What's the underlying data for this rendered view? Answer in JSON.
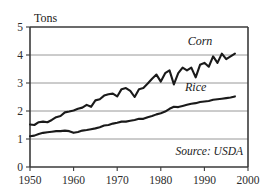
{
  "chart_data": {
    "type": "line",
    "title": "",
    "xlabel": "",
    "ylabel": "Tons",
    "xlim": [
      1950,
      2000
    ],
    "ylim": [
      0,
      5
    ],
    "grid": true,
    "grid_values": [
      1,
      2,
      3,
      4
    ],
    "legend_position": "inline-right",
    "annotations": [
      "Source: USDA"
    ],
    "xticks": [
      "1950",
      "1960",
      "1970",
      "1980",
      "1990",
      "2000"
    ],
    "xtick_values": [
      1950,
      1960,
      1970,
      1980,
      1990,
      2000
    ],
    "yticks": [
      "0",
      "1",
      "2",
      "3",
      "4",
      "5"
    ],
    "ytick_values": [
      0,
      1,
      2,
      3,
      4,
      5
    ],
    "x": [
      1950,
      1951,
      1952,
      1953,
      1954,
      1955,
      1956,
      1957,
      1958,
      1959,
      1960,
      1961,
      1962,
      1963,
      1964,
      1965,
      1966,
      1967,
      1968,
      1969,
      1970,
      1971,
      1972,
      1973,
      1974,
      1975,
      1976,
      1977,
      1978,
      1979,
      1980,
      1981,
      1982,
      1983,
      1984,
      1985,
      1986,
      1987,
      1988,
      1989,
      1990,
      1991,
      1992,
      1993,
      1994,
      1995,
      1996,
      1997
    ],
    "series": [
      {
        "name": "Corn",
        "label": "Corn",
        "color": "#1a1a1a",
        "label_x": 1989,
        "label_y": 4.35,
        "values": [
          1.52,
          1.5,
          1.6,
          1.62,
          1.6,
          1.68,
          1.78,
          1.82,
          1.95,
          1.98,
          2.02,
          2.08,
          2.12,
          2.22,
          2.15,
          2.38,
          2.42,
          2.55,
          2.6,
          2.62,
          2.52,
          2.78,
          2.82,
          2.72,
          2.5,
          2.78,
          2.82,
          2.98,
          3.15,
          3.3,
          3.05,
          3.35,
          3.45,
          2.95,
          3.35,
          3.55,
          3.45,
          3.55,
          3.2,
          3.65,
          3.72,
          3.58,
          3.95,
          3.72,
          4.05,
          3.85,
          3.95,
          4.05
        ]
      },
      {
        "name": "Rice",
        "label": "Rice",
        "color": "#1a1a1a",
        "label_x": 1988,
        "label_y": 2.72,
        "values": [
          1.1,
          1.12,
          1.18,
          1.22,
          1.24,
          1.26,
          1.28,
          1.28,
          1.3,
          1.28,
          1.22,
          1.25,
          1.3,
          1.32,
          1.35,
          1.38,
          1.42,
          1.48,
          1.5,
          1.55,
          1.58,
          1.62,
          1.62,
          1.65,
          1.68,
          1.72,
          1.72,
          1.78,
          1.82,
          1.88,
          1.92,
          1.98,
          2.08,
          2.15,
          2.14,
          2.18,
          2.22,
          2.26,
          2.28,
          2.32,
          2.34,
          2.36,
          2.4,
          2.42,
          2.44,
          2.46,
          2.48,
          2.52
        ]
      }
    ]
  },
  "axis": {
    "y_title": "Tons"
  },
  "footer": {
    "source": "Source: USDA"
  }
}
